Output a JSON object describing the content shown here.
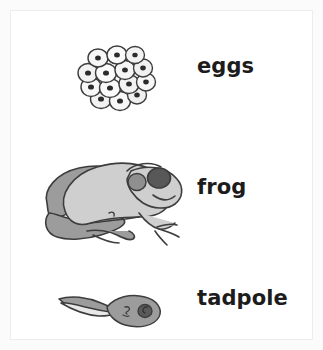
{
  "diagram": {
    "background_color": "#ffffff",
    "page_background_color": "#fbfbfb",
    "border_color": "#ededed",
    "text_color": "#1c1c1c"
  },
  "palette": {
    "outline": "#3d3d3d",
    "egg_fill": "#f7f7f7",
    "egg_nucleus": "#2b2b2b",
    "frog_body_light": "#cfcfcf",
    "frog_body_mid": "#9c9c9c",
    "frog_eye_dark": "#585858",
    "frog_tympanum": "#8f8f8f",
    "tadpole_body": "#9c9c9c",
    "tadpole_fin_light": "#e4e4e4",
    "tadpole_eye": "#5a5a5a"
  },
  "stages": [
    {
      "id": "eggs",
      "label": "eggs",
      "icon": "frog-eggs-cluster-icon",
      "order": 1,
      "egg_count": 14
    },
    {
      "id": "frog",
      "label": "frog",
      "icon": "adult-frog-icon",
      "order": 2
    },
    {
      "id": "tadpole",
      "label": "tadpole",
      "icon": "tadpole-icon",
      "order": 3
    }
  ]
}
